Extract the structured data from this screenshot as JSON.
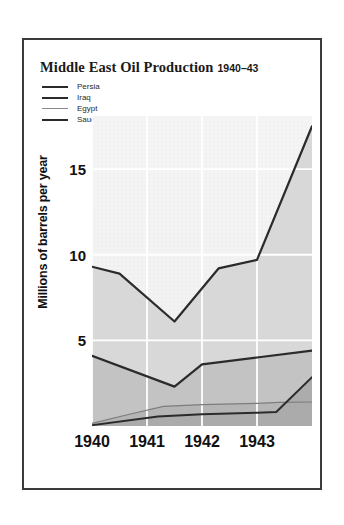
{
  "chart_data": {
    "type": "line",
    "title": "Middle East Oil Production",
    "subtitle": "1940–43",
    "xlabel": "",
    "ylabel": "Millions of barrels per year",
    "x_tick_labels": [
      "1940",
      "1941",
      "1942",
      "1943"
    ],
    "x_tick_values": [
      1940,
      1941,
      1942,
      1943
    ],
    "y_tick_labels": [
      "5",
      "10",
      "15"
    ],
    "y_tick_values": [
      5,
      10,
      15
    ],
    "xlim": [
      1940,
      1944
    ],
    "ylim": [
      0,
      18.1
    ],
    "grid": true,
    "legend_position": "top-left",
    "series": [
      {
        "name": "Persia",
        "color": "#2b2b2b",
        "width": 2.2,
        "x": [
          1940,
          1940.5,
          1941.5,
          1942.3,
          1943.0,
          1944.0
        ],
        "values": [
          9.3,
          8.9,
          6.1,
          9.2,
          9.7,
          17.5
        ]
      },
      {
        "name": "Iraq",
        "color": "#2b2b2b",
        "width": 2.2,
        "x": [
          1940,
          1941.5,
          1942.0,
          1943.0,
          1944.0
        ],
        "values": [
          4.1,
          2.3,
          3.6,
          4.0,
          4.4
        ]
      },
      {
        "name": "Egypt",
        "color": "#7d7d7d",
        "width": 1.2,
        "x": [
          1940,
          1940.7,
          1941.3,
          1942.0,
          1943.0,
          1943.4,
          1944.0
        ],
        "values": [
          0.15,
          0.7,
          1.15,
          1.25,
          1.32,
          1.38,
          1.4
        ]
      },
      {
        "name": "Saudi Arabia",
        "color": "#2b2b2b",
        "width": 2.0,
        "x": [
          1940,
          1941.2,
          1942.0,
          1943.0,
          1943.35,
          1944.0
        ],
        "values": [
          0.05,
          0.55,
          0.68,
          0.78,
          0.82,
          2.85
        ]
      }
    ]
  }
}
